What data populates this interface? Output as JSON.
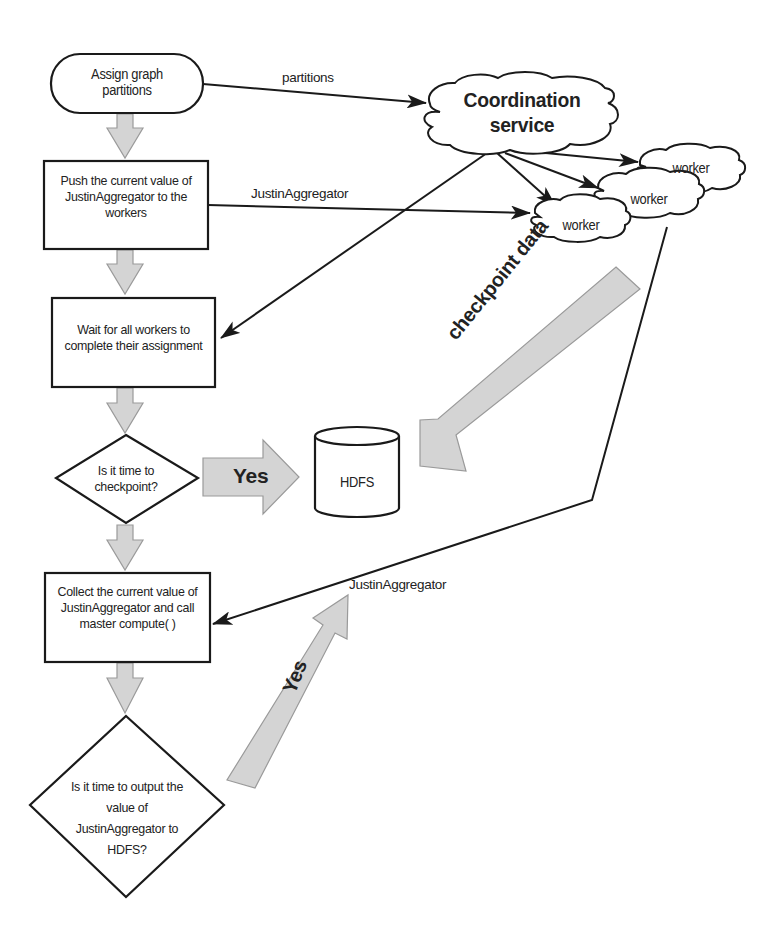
{
  "diagram": {
    "type": "flowchart",
    "nodes": {
      "assign": {
        "label": "Assign graph partitions",
        "shape": "rounded-rect"
      },
      "push": {
        "label": "Push the current value of JustinAggregator to the workers",
        "shape": "rect"
      },
      "wait": {
        "label": "Wait for all workers to complete their assignment",
        "shape": "rect"
      },
      "checkpoint_decision": {
        "label": "Is it time to checkpoint?",
        "shape": "diamond"
      },
      "collect": {
        "label": "Collect the current value of JustinAggregator and call master compute( )",
        "shape": "rect"
      },
      "output_decision": {
        "label": "Is it time to output the value of JustinAggregator to HDFS?",
        "shape": "diamond"
      },
      "coordination": {
        "label": "Coordination service",
        "shape": "cloud"
      },
      "worker1": {
        "label": "worker",
        "shape": "cloud"
      },
      "worker2": {
        "label": "worker",
        "shape": "cloud"
      },
      "worker3": {
        "label": "worker",
        "shape": "cloud"
      },
      "hdfs": {
        "label": "HDFS",
        "shape": "cylinder"
      }
    },
    "edge_labels": {
      "partitions": "partitions",
      "push_agg": "JustinAggregator",
      "collect_agg": "JustinAggregator",
      "checkpoint_yes": "Yes",
      "checkpoint_data": "checkpoint data",
      "output_yes": "Yes"
    },
    "colors": {
      "stroke": "#1a1a1a",
      "flow_arrow_fill": "#d4d4d4",
      "flow_arrow_stroke": "#9a9a9a"
    }
  }
}
